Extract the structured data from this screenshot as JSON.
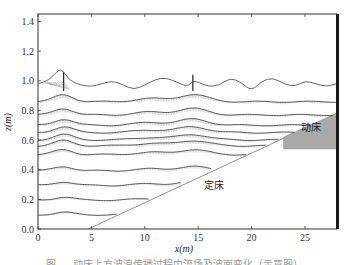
{
  "chart_data": {
    "type": "line",
    "title": "",
    "xlabel": "x(m)",
    "ylabel": "z(m)",
    "xlim": [
      0,
      28
    ],
    "ylim": [
      0,
      1.45
    ],
    "x_ticks": [
      0,
      5,
      10,
      15,
      20,
      25
    ],
    "y_ticks": [
      0.0,
      0.2,
      0.4,
      0.6,
      0.8,
      1.0,
      1.2,
      1.4
    ],
    "x_tick_labels": [
      "0",
      "5",
      "10",
      "15",
      "20",
      "25"
    ],
    "y_tick_labels": [
      "0.0",
      "0.2",
      "0.4",
      "0.6",
      "0.8",
      "1.0",
      "1.2",
      "1.4"
    ],
    "grid": false,
    "legend": null,
    "free_surface": {
      "name": "free surface",
      "x": [
        0,
        1,
        2,
        2.4,
        3,
        4,
        5,
        6,
        7,
        8,
        9,
        10,
        11,
        12,
        13,
        14,
        14.5,
        15,
        16,
        17,
        18,
        19,
        20,
        21,
        22,
        23,
        24,
        25,
        26,
        27,
        28
      ],
      "z": [
        0.98,
        1.0,
        1.08,
        1.06,
        1.0,
        0.97,
        0.96,
        0.98,
        1.0,
        0.97,
        0.94,
        0.97,
        1.01,
        1.02,
        0.99,
        0.96,
        1.0,
        0.99,
        0.96,
        0.97,
        1.02,
        0.99,
        0.93,
        1.0,
        1.02,
        0.98,
        0.96,
        1.0,
        0.98,
        0.96,
        0.98
      ]
    },
    "velocity_levels_z": [
      0.87,
      0.78,
      0.71,
      0.66,
      0.61,
      0.57,
      0.51,
      0.4,
      0.3,
      0.2,
      0.1
    ],
    "crest_positions_x": [
      2.4,
      10.5,
      14.5
    ],
    "fixed_bed_slope": {
      "x": [
        4.7,
        28
      ],
      "z": [
        0.0,
        0.78
      ]
    },
    "movable_bed": {
      "polygon_x": [
        23,
        28,
        28,
        23
      ],
      "polygon_z": [
        0.62,
        0.78,
        0.54,
        0.54
      ]
    },
    "annotations": [
      {
        "text": "动床",
        "x": 25.6,
        "z": 0.66
      },
      {
        "text": "定床",
        "x": 16.5,
        "z": 0.27
      }
    ]
  },
  "labels": {
    "xlabel": "x(m)",
    "ylabel": "z(m)",
    "movable_bed": "动床",
    "fixed_bed": "定床",
    "caption": "图 — 动床上方波浪传播过程中流场及波面变化（示意图）"
  }
}
